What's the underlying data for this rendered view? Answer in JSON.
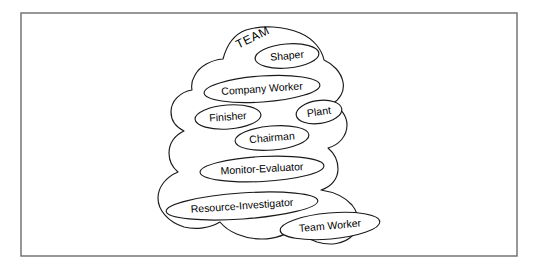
{
  "figure": {
    "title_label": "TEAM",
    "title_rotation_deg": -26,
    "title_font_size": 12,
    "title_x": 253,
    "title_y": 38,
    "frame": {
      "x": 21,
      "y": 13,
      "width": 496,
      "height": 243,
      "stroke_color": "#6b6b6b"
    },
    "background_color": "#ffffff",
    "line_color": "#1a1a1a",
    "text_color": "#000000",
    "blob_path": "M 246 30 C 262 25 284 26 300 33 C 314 39 322 50 324 60 C 333 64 341 72 343 82 C 345 92 339 100 332 104 C 341 108 347 116 347 125 C 347 136 339 145 328 148 C 334 153 338 161 338 169 C 338 179 331 187 321 190 C 334 192 345 197 352 205 C 360 215 360 228 352 236 C 344 244 330 246 317 242 C 308 239 300 233 296 226 C 288 234 276 239 262 239 C 244 239 228 232 220 222 C 210 228 196 230 184 227 C 168 222 158 210 158 198 C 158 187 166 177 178 172 C 172 167 169 160 169 153 C 169 143 175 135 184 131 C 176 127 171 120 171 112 C 171 101 180 92 192 90 C 191 85 192 80 195 75 C 200 66 211 60 223 59 C 227 44 235 34 246 30 Z"
  },
  "roles": [
    {
      "name": "Shaper",
      "cx": 287,
      "cy": 56,
      "rx": 32,
      "ry": 12,
      "rotation_deg": -5,
      "font_size": 10.5
    },
    {
      "name": "Company Worker",
      "cx": 262,
      "cy": 89,
      "rx": 58,
      "ry": 13,
      "rotation_deg": -4,
      "font_size": 10.5
    },
    {
      "name": "Finisher",
      "cx": 228,
      "cy": 117,
      "rx": 33,
      "ry": 12,
      "rotation_deg": -4,
      "font_size": 10.5
    },
    {
      "name": "Plant",
      "cx": 319,
      "cy": 112,
      "rx": 23,
      "ry": 11.5,
      "rotation_deg": -8,
      "font_size": 10.5
    },
    {
      "name": "Chairman",
      "cx": 272,
      "cy": 138,
      "rx": 37,
      "ry": 12,
      "rotation_deg": -5,
      "font_size": 10.5
    },
    {
      "name": "Monitor-Evaluator",
      "cx": 262,
      "cy": 169,
      "rx": 62,
      "ry": 12.5,
      "rotation_deg": -3,
      "font_size": 10.5
    },
    {
      "name": "Resource-Investigator",
      "cx": 242,
      "cy": 206,
      "rx": 76,
      "ry": 13,
      "rotation_deg": -4,
      "font_size": 10.5
    },
    {
      "name": "Team Worker",
      "cx": 330,
      "cy": 226,
      "rx": 50,
      "ry": 13,
      "rotation_deg": -5,
      "font_size": 10.5
    }
  ]
}
